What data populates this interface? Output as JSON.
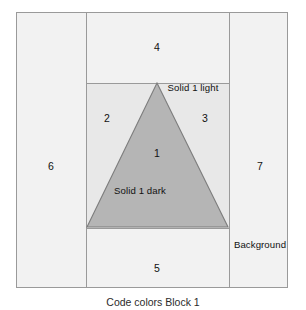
{
  "figure": {
    "caption": "Code colors Block 1",
    "frame": {
      "border_color": "#9a9a9a",
      "background_color": "#f2f2f2"
    }
  },
  "colors": {
    "page_background": "#ffffff",
    "region_fill": "#f2f2f2",
    "solid_light_fill": "#e8e8e8",
    "solid_dark_fill": "#b5b5b5",
    "line": "#9a9a9a",
    "triangle_stroke": "#7d7d7d",
    "text": "#111111"
  },
  "regions": [
    {
      "id": "1",
      "number": "1",
      "name": "Solid 1 dark",
      "fill": "#b5b5b5"
    },
    {
      "id": "2",
      "number": "2",
      "name": "Solid 1 light",
      "fill": "#e8e8e8"
    },
    {
      "id": "3",
      "number": "3",
      "name": "Solid 1 light",
      "fill": "#e8e8e8"
    },
    {
      "id": "4",
      "number": "4",
      "name": "Background",
      "fill": "#f2f2f2"
    },
    {
      "id": "5",
      "number": "5",
      "name": "Background",
      "fill": "#f2f2f2"
    },
    {
      "id": "6",
      "number": "6",
      "name": "Background",
      "fill": "#f2f2f2"
    },
    {
      "id": "7",
      "number": "7",
      "name": "Background",
      "fill": "#f2f2f2"
    }
  ],
  "labels": {
    "n1": "1",
    "n2": "2",
    "n3": "3",
    "n4": "4",
    "n5": "5",
    "n6": "6",
    "n7": "7",
    "solid_light": "Solid 1 light",
    "solid_dark": "Solid 1 dark",
    "background": "Background"
  },
  "geometry": {
    "triangle": {
      "apex": {
        "x": 157,
        "y": 83
      },
      "bottom_left": {
        "x": 87,
        "y": 227
      },
      "bottom_right": {
        "x": 228,
        "y": 227
      }
    },
    "frame": {
      "x": 16,
      "y": 12,
      "width": 272,
      "height": 276
    },
    "vertical_dividers_x": [
      86,
      228
    ],
    "horizontal_dividers_y": [
      83,
      227
    ]
  }
}
